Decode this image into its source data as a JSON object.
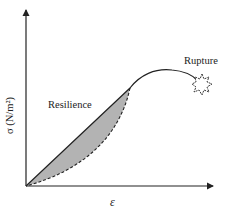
{
  "diagram": {
    "type": "stress-strain curve",
    "y_axis_label": "σ (N/m²)",
    "x_axis_label": "ε",
    "region_label": "Resilience",
    "failure_label": "Rupture",
    "colors": {
      "line": "#222222",
      "shaded_area": "#b3b3b3",
      "background": "#ffffff"
    },
    "elements": [
      {
        "name": "loading-curve",
        "style": "solid"
      },
      {
        "name": "unloading-curve",
        "style": "dashed"
      },
      {
        "name": "resilience-area",
        "style": "shaded gray"
      },
      {
        "name": "rupture-marker",
        "style": "starburst outline"
      }
    ]
  }
}
